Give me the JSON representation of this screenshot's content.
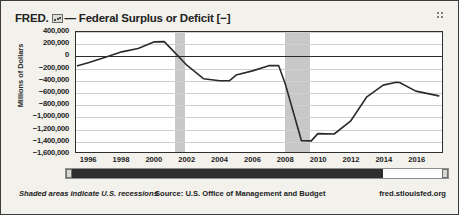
{
  "header": {
    "brand": "FRED.",
    "mini_icon": "mini-chart-icon",
    "title": "— Federal Surplus or Deficit [−]",
    "grip_icon": "grip-dots-icon"
  },
  "footer": {
    "recession_note": "Shaded areas indicate U.S. recessions",
    "source": "Source: U.S. Office of Management and Budget",
    "url": "fred.stlouisfed.org"
  },
  "scrollbar": {
    "fill_percent": 83,
    "left_handle": "range-handle-left",
    "right_handle": "range-handle-right"
  },
  "colors": {
    "line": "#2b2b2b",
    "recession_band": "#c8c8c8",
    "grid": "#cfcfcf",
    "zero_line": "#2b2b2b",
    "background": "#f2f1ec",
    "plot_background": "#ffffff"
  },
  "chart_data": {
    "type": "line",
    "title": "Federal Surplus or Deficit [−]",
    "xlabel": "",
    "ylabel": "Millions of Dollars",
    "xlim": [
      1995.2,
      2017.6
    ],
    "ylim": [
      -1600000,
      400000
    ],
    "grid": true,
    "legend": "none",
    "y_ticks": [
      400000,
      200000,
      0,
      -200000,
      -400000,
      -600000,
      -800000,
      -1000000,
      -1200000,
      -1400000,
      -1600000
    ],
    "y_tick_labels": [
      "400,000",
      "200,000",
      "0",
      "−200,000",
      "−400,000",
      "−600,000",
      "−800,000",
      "−1,000,000",
      "−1,200,000",
      "−1,400,000",
      "−1,600,000"
    ],
    "x_ticks": [
      1996,
      1998,
      2000,
      2002,
      2004,
      2006,
      2008,
      2010,
      2012,
      2014,
      2016
    ],
    "x_tick_labels": [
      "1996",
      "1998",
      "2000",
      "2002",
      "2004",
      "2006",
      "2008",
      "2010",
      "2012",
      "2014",
      "2016"
    ],
    "series": [
      {
        "name": "Federal Surplus or Deficit [−]",
        "color": "#2b2b2b",
        "x": [
          1995.3,
          1996,
          1997,
          1998,
          1999,
          2000,
          2000.6,
          2001,
          2002,
          2003,
          2004,
          2004.6,
          2005,
          2006,
          2007,
          2007.6,
          2008,
          2009,
          2009.6,
          2010,
          2011,
          2012,
          2013,
          2014,
          2014.8,
          2015,
          2016,
          2017.4
        ],
        "y": [
          -164000,
          -107000,
          -22000,
          69000,
          126000,
          236000,
          240000,
          128000,
          -158000,
          -378000,
          -413000,
          -412000,
          -318000,
          -248000,
          -161000,
          -160000,
          -459000,
          -1413000,
          -1415000,
          -1294000,
          -1300000,
          -1087000,
          -680000,
          -485000,
          -438000,
          -442000,
          -585000,
          -665000
        ]
      }
    ],
    "recession_bands": [
      {
        "start": 2001.2,
        "end": 2001.85,
        "label": "2001 recession"
      },
      {
        "start": 2007.95,
        "end": 2009.45,
        "label": "2008-2009 recession"
      }
    ]
  }
}
